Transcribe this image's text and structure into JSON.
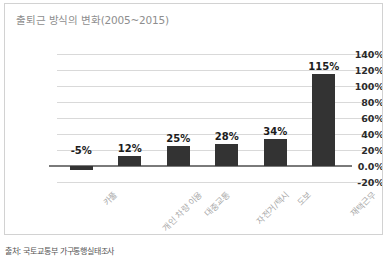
{
  "card": {
    "title": "출퇴근 방식의 변화(2005~2015)",
    "border_color": "#d2d2d2",
    "background": "#ffffff"
  },
  "source_note": "출처: 국토교통부 가구통행실태조사",
  "chart_data": {
    "type": "bar",
    "title": "출퇴근 방식의 변화(2005~2015)",
    "xlabel": "",
    "ylabel": "",
    "categories": [
      "카풀",
      "개인 차량 이용",
      "대중교통",
      "자전거/택시",
      "도보",
      "재택근무"
    ],
    "values": [
      -5,
      12,
      25,
      28,
      34,
      115
    ],
    "data_labels": [
      "-5%",
      "12%",
      "25%",
      "28%",
      "34%",
      "115%"
    ],
    "ylim": [
      -20,
      140
    ],
    "ytick_values": [
      140,
      120,
      100,
      80,
      60,
      40,
      20,
      0,
      -20
    ],
    "ytick_labels": [
      "140%",
      "120%",
      "100%",
      "80%",
      "60%",
      "40%",
      "20%",
      "0.0%",
      "-20%"
    ],
    "grid": true,
    "legend": "none",
    "bar_color": "#333333",
    "gridline_color": "#d9d9d9",
    "zeroline_color": "#7a7a7a",
    "title_color": "#8e8e8e",
    "category_label_color": "#a9a9a9",
    "category_label_rotation": -45,
    "value_suffix": "%"
  }
}
